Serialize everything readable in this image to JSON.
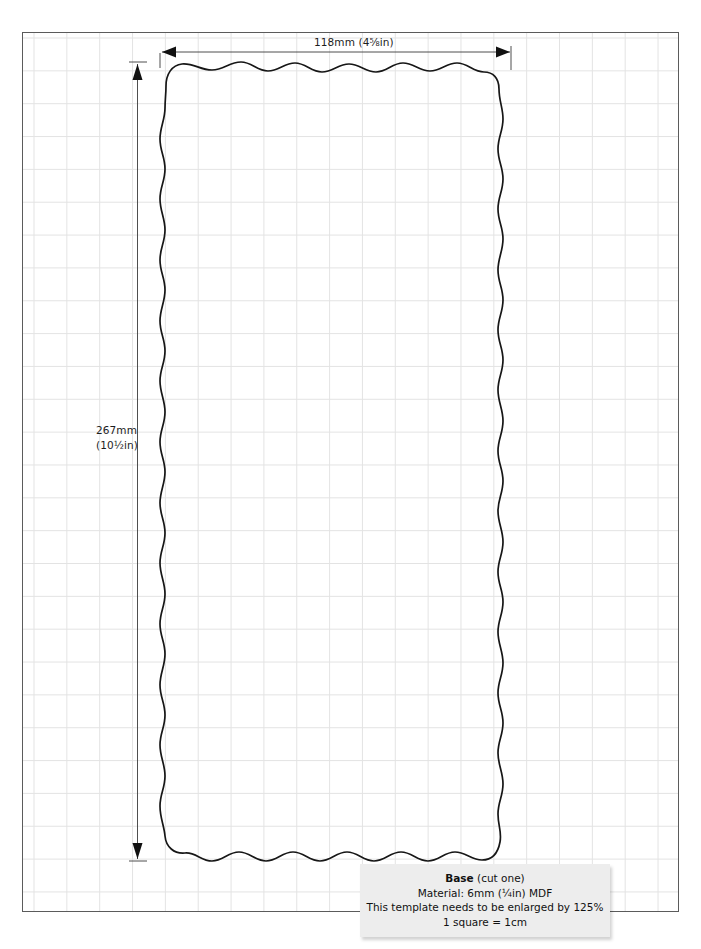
{
  "document": {
    "type": "cutting-template",
    "background": "#ffffff",
    "sheet_border_color": "#5b5b5b",
    "grid_line_color": "#e3e3e3",
    "grid_square_label": "1 square = 1cm",
    "outline_color": "#1a1a1a"
  },
  "dimensions": {
    "width": {
      "label": "118mm (4⅝in)",
      "value_mm": 118,
      "value_in": "4⅝"
    },
    "height": {
      "label_line1": "267mm",
      "label_line2": "(10½in)",
      "value_mm": 267,
      "value_in": "10½"
    }
  },
  "caption": {
    "title": "Base",
    "title_suffix": " (cut one)",
    "material": "Material:  6mm (¼in) MDF",
    "enlarge_note": "This template needs to be enlarged by 125%",
    "scale_note": "1 square = 1cm",
    "background": "#ededed"
  },
  "shape": {
    "name": "base-panel-outline",
    "style": "wavy scalloped rectangle",
    "left_px": 160,
    "top_px": 62,
    "right_px": 503,
    "bottom_px": 861
  }
}
